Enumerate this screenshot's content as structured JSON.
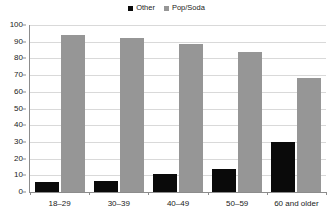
{
  "chart_data": {
    "type": "bar",
    "title": "",
    "xlabel": "",
    "ylabel": "",
    "categories": [
      "18–29",
      "30–39",
      "40–49",
      "50–59",
      "60 and older"
    ],
    "series": [
      {
        "name": "Other",
        "color": "#0a0a0a",
        "values": [
          6,
          6.5,
          10.5,
          14,
          30
        ]
      },
      {
        "name": "Pop/Soda",
        "color": "#969696",
        "values": [
          94,
          92.5,
          88.5,
          84,
          68
        ]
      }
    ],
    "ylim": [
      0,
      100
    ],
    "ytick_step": 10,
    "yticks": [
      0,
      10,
      20,
      30,
      40,
      50,
      60,
      70,
      80,
      90,
      100
    ],
    "ytick_labels": [
      "0",
      "10",
      "20",
      "30",
      "40",
      "50",
      "60",
      "70",
      "80",
      "90",
      "100"
    ],
    "grid": true,
    "grid_axis": "y",
    "legend": true,
    "legend_position": "top-center",
    "legend_entries": [
      "Other",
      "Pop/Soda"
    ],
    "background": "#ffffff",
    "gridline_color": "#d9d9d9",
    "axis_color": "#8c8c8c"
  }
}
